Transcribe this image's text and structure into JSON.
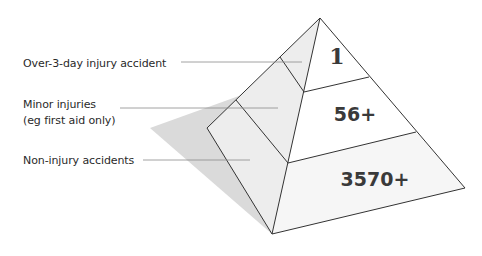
{
  "diagram": {
    "type": "accident-pyramid",
    "colors": {
      "background": "#ffffff",
      "shadow": "#d9d9d9",
      "left_face": "#ececec",
      "right_face": "#ffffff",
      "bottom_band_fill": "#f7f7f7",
      "outline": "#333333",
      "leader_line": "#8a8a8a",
      "label_text": "#2a2a2a",
      "value_text": "#3a3a3a"
    },
    "levels": [
      {
        "label": "Over-3-day injury accident",
        "value": "1"
      },
      {
        "label_line1": "Minor injuries",
        "label_line2": "(eg first aid only)",
        "value": "56+"
      },
      {
        "label": "Non-injury accidents",
        "value": "3570+"
      }
    ]
  }
}
